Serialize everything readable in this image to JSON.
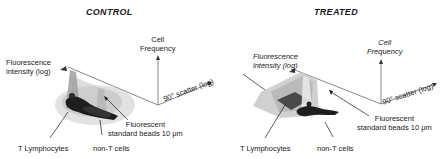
{
  "panels": [
    {
      "title": "CONTROL",
      "labels": {
        "cell_frequency_line1": "Cell",
        "cell_frequency_line2": "Frequency",
        "fluorescence_line1": "Fluorescence",
        "fluorescence_line2": "intensity (log)",
        "scatter": "90° scatter (log)",
        "beads_line1": "Fluorescent",
        "beads_line2": "standard beads 10 μm",
        "t_lymphocytes": "T Lymphocytes",
        "non_t_cells": "non-T cells"
      }
    },
    {
      "title": "TREATED",
      "labels": {
        "cell_frequency_line1": "Cell",
        "cell_frequency_line2": "Frequency",
        "fluorescence_line1": "Fluorescence",
        "fluorescence_line2": "intensity (log)",
        "scatter": "90° scatter (log)",
        "beads_line1": "Fluorescent",
        "beads_line2": "standard beads 10 μm",
        "t_lymphocytes": "T Lymphocytes",
        "non_t_cells": "non-T cells"
      }
    }
  ],
  "colors": {
    "ink": "#1a1a1a",
    "axis": "#555555",
    "surface_light": "#c8c8c8",
    "surface_dark": "#4a4a4a"
  }
}
